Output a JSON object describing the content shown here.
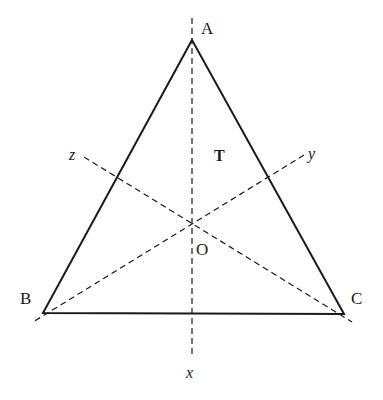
{
  "diagram": {
    "colors": {
      "stroke": "#1a1a1a",
      "background": "#ffffff"
    },
    "vertices": {
      "A": {
        "label": "A",
        "x": 192,
        "y": 40
      },
      "B": {
        "label": "B",
        "x": 43,
        "y": 313
      },
      "C": {
        "label": "C",
        "x": 344,
        "y": 314
      }
    },
    "center": {
      "label": "O",
      "x": 192,
      "y": 222
    },
    "region_label": "T",
    "axes": {
      "x": {
        "label": "x"
      },
      "y": {
        "label": "y"
      },
      "z": {
        "label": "z"
      }
    }
  }
}
